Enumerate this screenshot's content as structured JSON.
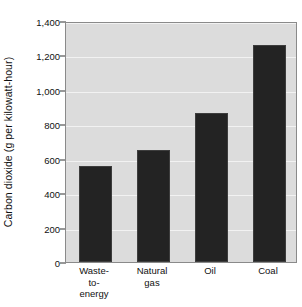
{
  "chart_data": {
    "type": "bar",
    "title": "",
    "xlabel": "",
    "ylabel": "Carbon dioxide (g per kilowatt-hour)",
    "categories": [
      "Waste-to-energy",
      "Natural gas",
      "Oil",
      "Coal"
    ],
    "category_lines": [
      [
        "Waste-",
        "to-",
        "energy"
      ],
      [
        "Natural",
        "gas"
      ],
      [
        "Oil"
      ],
      [
        "Coal"
      ]
    ],
    "values": [
      555,
      650,
      865,
      1260
    ],
    "ylim": [
      0,
      1400
    ],
    "ytick_values": [
      0,
      200,
      400,
      600,
      800,
      1000,
      1200,
      1400
    ],
    "ytick_labels": [
      "0",
      "200",
      "400",
      "600",
      "800",
      "1,000",
      "1,200",
      "1,400"
    ],
    "grid": true,
    "legend": false,
    "colors": {
      "bar": "#232323",
      "plot_background": "#dcdcdc",
      "gridline": "#f2f2f2",
      "axis": "#8a8a8a",
      "text": "#111111"
    }
  }
}
